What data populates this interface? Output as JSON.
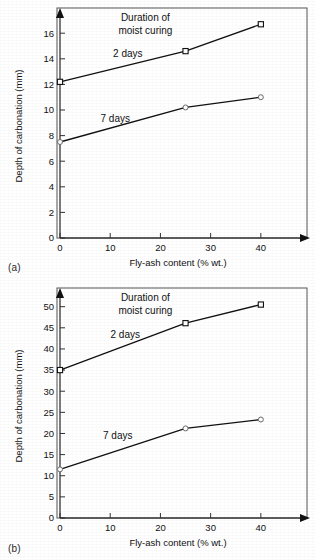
{
  "figure": {
    "background_color": "#ffffff",
    "ink_color": "#111111",
    "frame_color": "#555555"
  },
  "panels": [
    {
      "caption": "(a)",
      "annotation_line1": "Duration of",
      "annotation_line2": "moist curing"
    },
    {
      "caption": "(b)",
      "annotation_line1": "Duration of",
      "annotation_line2": "moist curing"
    }
  ],
  "chart_data": [
    {
      "type": "line",
      "panel": "(a)",
      "title": "Duration of moist curing",
      "xlabel": "Fly-ash content (% wt.)",
      "ylabel": "Depth of carbonation (mm)",
      "x": [
        0,
        25,
        40
      ],
      "xlim": [
        0,
        47
      ],
      "ylim": [
        0,
        17.5
      ],
      "xticks": [
        0,
        10,
        20,
        30,
        40
      ],
      "xtick_labels": [
        "0",
        "10",
        "20",
        "30",
        "40"
      ],
      "yticks": [
        0,
        2,
        4,
        6,
        8,
        10,
        12,
        14,
        16
      ],
      "ytick_labels": [
        "0",
        "2",
        "4",
        "6",
        "8",
        "10",
        "12",
        "14",
        "16"
      ],
      "grid": false,
      "legend_position": "inline-labels",
      "series": [
        {
          "name": "2 days",
          "marker": "open-square",
          "label_x": 13.5,
          "label_y": 14.15,
          "values": [
            12.2,
            14.6,
            16.7
          ]
        },
        {
          "name": "7 days",
          "marker": "open-circle",
          "label_x": 11.0,
          "label_y": 9.05,
          "values": [
            7.5,
            10.2,
            11.0
          ]
        }
      ]
    },
    {
      "type": "line",
      "panel": "(b)",
      "title": "Duration of moist curing",
      "xlabel": "Fly-ash content (% wt.)",
      "ylabel": "Depth of carbonation (mm)",
      "x": [
        0,
        25,
        40
      ],
      "xlim": [
        0,
        47
      ],
      "ylim": [
        0,
        53
      ],
      "xticks": [
        0,
        10,
        20,
        30,
        40
      ],
      "xtick_labels": [
        "0",
        "10",
        "20",
        "30",
        "40"
      ],
      "yticks": [
        0,
        5,
        10,
        15,
        20,
        25,
        30,
        35,
        40,
        45,
        50
      ],
      "ytick_labels": [
        "0",
        "5",
        "10",
        "15",
        "20",
        "25",
        "30",
        "35",
        "40",
        "45",
        "50"
      ],
      "grid": false,
      "legend_position": "inline-labels",
      "series": [
        {
          "name": "2 days",
          "marker": "open-square",
          "label_x": 13.0,
          "label_y": 42.6,
          "values": [
            35.0,
            46.1,
            50.5
          ]
        },
        {
          "name": "7 days",
          "marker": "open-circle",
          "label_x": 11.5,
          "label_y": 18.6,
          "values": [
            11.5,
            21.2,
            23.3
          ]
        }
      ]
    }
  ]
}
